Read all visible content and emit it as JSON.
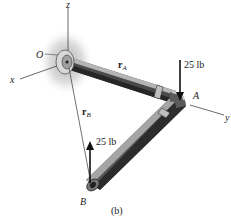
{
  "figure": {
    "caption": "(b)",
    "axes": {
      "x_label": "x",
      "y_label": "y",
      "z_label": "z",
      "origin_label": "O"
    },
    "points": {
      "A": "A",
      "B": "B"
    },
    "position_vectors": {
      "rA": {
        "symbol": "r",
        "subscript": "A"
      },
      "rB": {
        "symbol": "r",
        "subscript": "B"
      }
    },
    "forces": {
      "at_A": {
        "label": "25 lb",
        "direction": "down"
      },
      "at_B": {
        "label": "25 lb",
        "direction": "up"
      }
    },
    "colors": {
      "pipe_dark": "#3a3a3a",
      "pipe_light": "#9a9a9a",
      "axis": "#444444",
      "shadow": "#bdbdbd"
    }
  }
}
